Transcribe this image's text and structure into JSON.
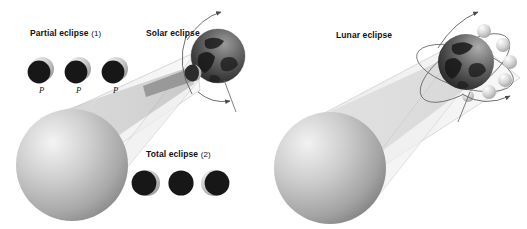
{
  "figure": {
    "type": "astronomy-diagram",
    "background_color": "#ffffff",
    "palette": {
      "sun_light": "#f2f2f2",
      "sun_mid": "#b9b9b9",
      "sun_dark": "#8d8d8d",
      "penumbra": "#ececec",
      "umbra": "#c9c9c9",
      "moon_light": "#d8d8d8",
      "moon_shadow": "#1c1c1c",
      "earth_dark": "#3a3a3a",
      "earth_land": "#1e1e1e",
      "line": "#6e6e6e",
      "text": "#111111"
    }
  },
  "panels": {
    "solar": {
      "title": "Solar eclipse",
      "partial": {
        "label_text": "Partial eclipse",
        "label_number": "(1)",
        "marker": "P",
        "markers": [
          "P",
          "P",
          "P"
        ],
        "count": 3
      },
      "total": {
        "label_text": "Total eclipse",
        "label_number": "(2)",
        "count": 3
      },
      "bodies": {
        "sun": "sun-sphere",
        "earth": "earth-globe",
        "moon": "moon-sphere"
      }
    },
    "lunar": {
      "title": "Lunar eclipse",
      "bodies": {
        "sun": "sun-sphere",
        "earth": "earth-globe",
        "moons_on_orbit": 6
      }
    }
  }
}
